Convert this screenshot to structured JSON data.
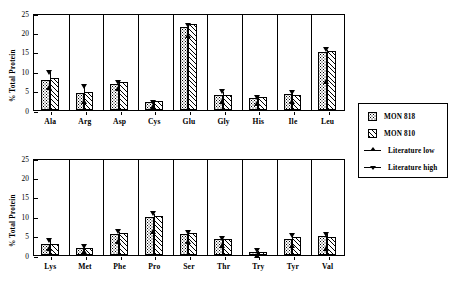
{
  "legend": {
    "items": [
      {
        "label": "MON 818",
        "kind": "dots"
      },
      {
        "label": "MON 810",
        "kind": "hatch"
      },
      {
        "label": "Literature low",
        "kind": "tri-up"
      },
      {
        "label": "Literature high",
        "kind": "tri-down"
      }
    ]
  },
  "chart_data": [
    {
      "type": "bar",
      "title": "",
      "panel": "top",
      "xlabel": "",
      "ylabel": "% Total Protein",
      "ylim": [
        0,
        25
      ],
      "yticks": [
        0,
        5,
        10,
        15,
        20,
        25
      ],
      "grid": false,
      "legend_position": "right",
      "categories": [
        "Ala",
        "Arg",
        "Asp",
        "Cys",
        "Glu",
        "Gly",
        "His",
        "Ile",
        "Leu"
      ],
      "series": [
        {
          "name": "MON 818",
          "values": [
            7.8,
            4.5,
            6.7,
            2.0,
            21.3,
            3.9,
            3.0,
            4.0,
            14.9
          ]
        },
        {
          "name": "MON 810",
          "values": [
            8.3,
            4.6,
            7.2,
            2.2,
            22.2,
            3.9,
            3.3,
            3.8,
            15.3
          ]
        }
      ],
      "annotations": [
        {
          "name": "Literature low",
          "values": [
            6.3,
            2.6,
            6.0,
            1.4,
            19.8,
            2.6,
            2.3,
            2.7,
            7.8
          ]
        },
        {
          "name": "Literature high",
          "values": [
            10.2,
            6.7,
            7.7,
            2.4,
            22.3,
            5.2,
            3.7,
            4.9,
            16.1
          ]
        }
      ]
    },
    {
      "type": "bar",
      "title": "",
      "panel": "bottom",
      "xlabel": "",
      "ylabel": "% Total Protein",
      "ylim": [
        0,
        25
      ],
      "yticks": [
        0,
        5,
        10,
        15,
        20,
        25
      ],
      "grid": false,
      "legend_position": "right",
      "categories": [
        "Lys",
        "Met",
        "Phe",
        "Pro",
        "Ser",
        "Thr",
        "Try",
        "Tyr",
        "Val"
      ],
      "series": [
        {
          "name": "MON 818",
          "values": [
            2.9,
            1.8,
            5.5,
            9.8,
            5.4,
            4.0,
            0.8,
            4.2,
            4.8
          ]
        },
        {
          "name": "MON 810",
          "values": [
            2.9,
            1.8,
            5.7,
            10.1,
            5.7,
            4.1,
            0.8,
            4.6,
            4.7
          ]
        }
      ],
      "annotations": [
        {
          "name": "Literature low",
          "values": [
            2.3,
            1.3,
            4.0,
            6.7,
            4.0,
            3.0,
            0.5,
            3.0,
            2.2
          ]
        },
        {
          "name": "Literature high",
          "values": [
            4.3,
            2.6,
            6.5,
            11.2,
            6.3,
            4.7,
            1.6,
            5.6,
            5.9
          ]
        }
      ]
    }
  ]
}
